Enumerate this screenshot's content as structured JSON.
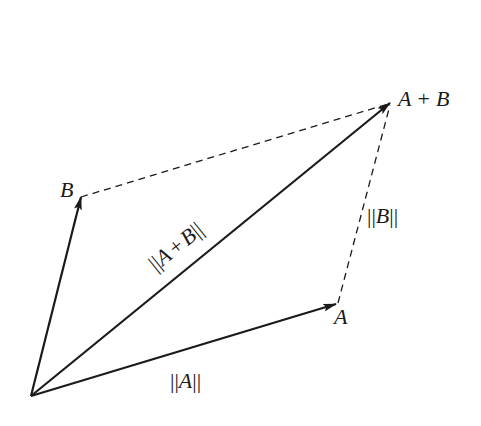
{
  "diagram": {
    "colors": {
      "ink": "#1a1a1a",
      "background": "#ffffff"
    },
    "origin": {
      "x": 31,
      "y": 396
    },
    "vectors": [
      {
        "id": "A",
        "tip": {
          "x": 336,
          "y": 304
        },
        "style": "solid"
      },
      {
        "id": "B",
        "tip": {
          "x": 81,
          "y": 197
        },
        "style": "solid"
      },
      {
        "id": "A+B",
        "tip": {
          "x": 390,
          "y": 103
        },
        "style": "solid"
      }
    ],
    "dashed_edges": [
      {
        "from": "B",
        "to": "A+B"
      },
      {
        "from": "A",
        "to": "A+B"
      }
    ],
    "labels": {
      "a_tip": "A",
      "b_tip": "B",
      "sum_tip": "A + B",
      "norm_a": "||A||",
      "norm_b": "||B||",
      "norm_sum": "||A + B||"
    }
  }
}
